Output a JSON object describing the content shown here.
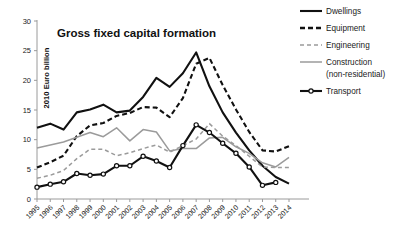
{
  "chart_data": {
    "type": "line",
    "title": "Gross fixed capital formation",
    "xlabel": "",
    "ylabel": "2010 Euro billion",
    "ylim": [
      0,
      30
    ],
    "yticks": [
      0,
      5,
      10,
      15,
      20,
      25,
      30
    ],
    "grid": false,
    "legend_position": "top-right",
    "categories": [
      "1995",
      "1996",
      "1997",
      "1998",
      "1999",
      "2000",
      "2001",
      "2002",
      "2003",
      "2004",
      "2005",
      "2006",
      "2007",
      "2008",
      "2009",
      "2010",
      "2011",
      "2012",
      "2013",
      "2014"
    ],
    "series": [
      {
        "name": "Dwellings",
        "color": "#111111",
        "style": "solid",
        "marker": "none",
        "values": [
          12.0,
          12.7,
          11.7,
          14.6,
          15.1,
          15.9,
          14.6,
          14.9,
          17.2,
          20.4,
          18.9,
          21.2,
          24.7,
          19.0,
          14.6,
          11.2,
          8.2,
          5.6,
          3.7,
          2.6
        ]
      },
      {
        "name": "Equipment",
        "color": "#111111",
        "style": "dashed",
        "marker": "none",
        "values": [
          5.3,
          6.2,
          7.3,
          10.6,
          12.4,
          12.8,
          14.0,
          14.5,
          15.5,
          15.4,
          13.8,
          17.0,
          22.8,
          23.8,
          19.2,
          15.1,
          11.3,
          8.2,
          8.0,
          8.9
        ]
      },
      {
        "name": "Engineering",
        "color": "#9b9b9b",
        "style": "dashed",
        "marker": "none",
        "values": [
          3.5,
          4.0,
          4.8,
          6.8,
          8.4,
          8.4,
          7.3,
          7.8,
          8.5,
          9.1,
          7.9,
          9.0,
          10.1,
          12.7,
          10.6,
          9.0,
          7.2,
          5.4,
          5.3,
          5.3
        ]
      },
      {
        "name": "Construction (non-residential)",
        "color": "#9b9b9b",
        "style": "solid",
        "marker": "none",
        "values": [
          8.6,
          9.1,
          9.6,
          10.4,
          11.2,
          10.5,
          12.0,
          9.8,
          11.7,
          11.3,
          8.1,
          8.5,
          8.5,
          10.3,
          10.4,
          8.8,
          7.7,
          6.1,
          5.4,
          7.0
        ]
      },
      {
        "name": "Transport",
        "color": "#111111",
        "style": "solid",
        "marker": "circle",
        "values": [
          2.0,
          2.5,
          2.9,
          4.3,
          4.0,
          4.2,
          5.6,
          5.6,
          7.2,
          6.4,
          5.3,
          9.0,
          12.5,
          11.2,
          9.4,
          7.7,
          5.4,
          2.3,
          2.8,
          null
        ]
      }
    ]
  },
  "legend": {
    "items": [
      {
        "label": "Dwellings"
      },
      {
        "label": "Equipment"
      },
      {
        "label": "Engineering"
      },
      {
        "label": "Construction"
      },
      {
        "label": "(non-residential)"
      },
      {
        "label": "Transport"
      }
    ]
  }
}
